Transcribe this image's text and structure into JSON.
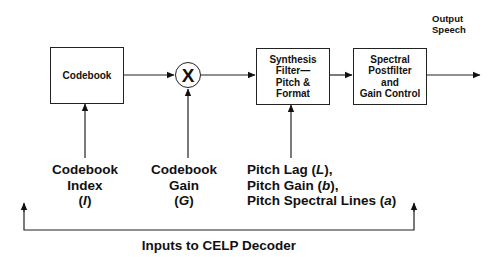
{
  "diagram": {
    "blocks": {
      "codebook": {
        "label": "Codebook"
      },
      "multiplier": {
        "symbol": "X"
      },
      "synthesis_filter": {
        "lines": [
          "Synthesis",
          "Filter—",
          "Pitch &",
          "Format"
        ]
      },
      "spectral_postfilter": {
        "lines": [
          "Spectral",
          "Postfilter",
          "and",
          "Gain Control"
        ]
      }
    },
    "output": {
      "lines": [
        "Output",
        "Speech"
      ]
    },
    "inputs": {
      "codebook_index": {
        "lines": [
          "Codebook",
          "Index",
          "(I)"
        ],
        "symbol": "I"
      },
      "codebook_gain": {
        "lines": [
          "Codebook",
          "Gain",
          "(G)"
        ],
        "symbol": "G"
      },
      "pitch_params": {
        "lines": [
          "Pitch Lag (L),",
          "Pitch Gain (b),",
          "Pitch Spectral Lines (a)"
        ],
        "line1_prefix": "Pitch Lag (",
        "line1_sym": "L",
        "line1_suffix": "),",
        "line2_prefix": "Pitch Gain (",
        "line2_sym": "b",
        "line2_suffix": "),",
        "line3_prefix": "Pitch Spectral Lines (",
        "line3_sym": "a",
        "line3_suffix": ")"
      }
    },
    "footer": {
      "caption": "Inputs to CELP Decoder"
    },
    "colors": {
      "stroke": "#222222",
      "text": "#111111",
      "background": "#ffffff"
    }
  }
}
